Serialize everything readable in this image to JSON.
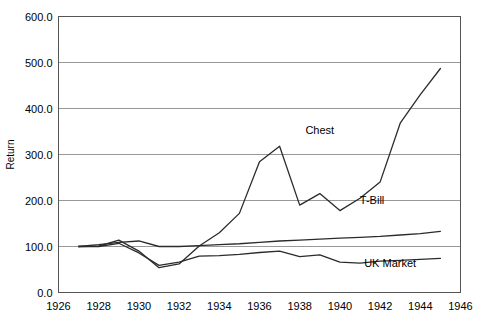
{
  "chart_data": {
    "type": "line",
    "title": "",
    "xlabel": "",
    "ylabel": "Return",
    "xlim": [
      1926,
      1946
    ],
    "ylim": [
      0,
      600
    ],
    "grid": true,
    "grid_axis": "y",
    "legend_position": "inline-right",
    "x_tick_labels": [
      "1926",
      "1928",
      "1930",
      "1932",
      "1934",
      "1936",
      "1938",
      "1940",
      "1942",
      "1944",
      "1946"
    ],
    "x_ticks": [
      1926,
      1928,
      1930,
      1932,
      1934,
      1936,
      1938,
      1940,
      1942,
      1944,
      1946
    ],
    "y_tick_labels": [
      "0.0",
      "100.0",
      "200.0",
      "300.0",
      "400.0",
      "500.0",
      "600.0"
    ],
    "y_ticks": [
      0,
      100,
      200,
      300,
      400,
      500,
      600
    ],
    "x": [
      1927,
      1928,
      1929,
      1930,
      1931,
      1932,
      1933,
      1934,
      1935,
      1936,
      1937,
      1938,
      1939,
      1940,
      1941,
      1942,
      1943,
      1944,
      1945
    ],
    "series": [
      {
        "name": "Chest",
        "color": "#2b2b2b",
        "label_x": 1939.0,
        "label_y": 345,
        "values": [
          100,
          101,
          114,
          90,
          54,
          62,
          101,
          130,
          172,
          284,
          318,
          190,
          215,
          178,
          205,
          240,
          368,
          430,
          487
        ]
      },
      {
        "name": "T-Bill",
        "color": "#2b2b2b",
        "label_x": 1941.6,
        "label_y": 192,
        "values": [
          100,
          104,
          109,
          112,
          100,
          100,
          102,
          104,
          106,
          109,
          112,
          114,
          116,
          118,
          120,
          122,
          125,
          128,
          133
        ]
      },
      {
        "name": "UK Market",
        "color": "#2b2b2b",
        "label_x": 1942.5,
        "label_y": 55,
        "values": [
          100,
          100,
          107,
          86,
          59,
          66,
          79,
          80,
          83,
          87,
          90,
          78,
          82,
          66,
          64,
          68,
          70,
          72,
          74
        ]
      }
    ]
  }
}
